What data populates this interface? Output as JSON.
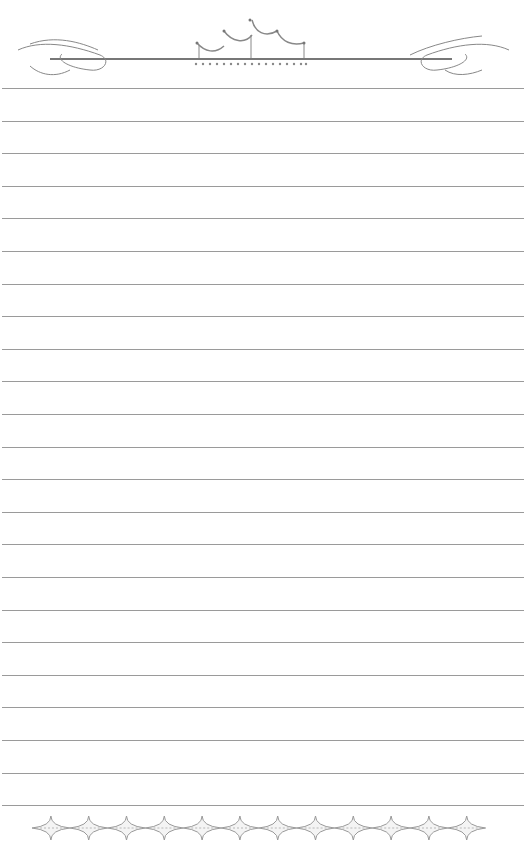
{
  "page": {
    "type": "decorative-lined-paper",
    "line_count": 23,
    "first_line_y": 88,
    "line_spacing": 32.6,
    "line_color": "#9a9a9a",
    "ornament_color": "#8a8a8a"
  },
  "header": {
    "ornament": "crown-with-flourishes"
  },
  "footer": {
    "ornament": "diamond-chain",
    "diamond_count": 12
  }
}
